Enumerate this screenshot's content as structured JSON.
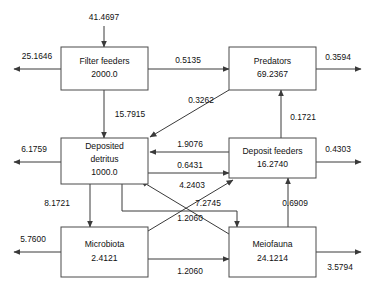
{
  "diagram": {
    "type": "ecological-flow-network",
    "nodes": [
      {
        "id": "filter_feeders",
        "label": "Filter feeders",
        "value": "2000.0",
        "lines": [
          "Filter feeders",
          "2000.0"
        ]
      },
      {
        "id": "predators",
        "label": "Predators",
        "value": "69.2367",
        "lines": [
          "Predators",
          "69.2367"
        ]
      },
      {
        "id": "deposited_detritus",
        "label": "Deposited detritus",
        "value": "1000.0",
        "lines": [
          "Deposited",
          "detritus",
          "1000.0"
        ]
      },
      {
        "id": "deposit_feeders",
        "label": "Deposit feeders",
        "value": "16.2740",
        "lines": [
          "Deposit feeders",
          "16.2740"
        ]
      },
      {
        "id": "microbiota",
        "label": "Microbiota",
        "value": "2.4121",
        "lines": [
          "Microbiota",
          "2.4121"
        ]
      },
      {
        "id": "meiofauna",
        "label": "Meiofauna",
        "value": "24.1214",
        "lines": [
          "Meiofauna",
          "24.1214"
        ]
      }
    ],
    "flows": [
      {
        "id": "input_filter_feeders",
        "value": "41.4697",
        "from": "external",
        "to": "filter_feeders"
      },
      {
        "id": "output_filter_feeders",
        "value": "25.1646",
        "from": "filter_feeders",
        "to": "external"
      },
      {
        "id": "filter_to_predators",
        "value": "0.5135",
        "from": "filter_feeders",
        "to": "predators"
      },
      {
        "id": "output_predators",
        "value": "0.3594",
        "from": "predators",
        "to": "external"
      },
      {
        "id": "filter_to_detritus",
        "value": "15.7915",
        "from": "filter_feeders",
        "to": "deposited_detritus"
      },
      {
        "id": "predators_to_detritus",
        "value": "0.3262",
        "from": "predators",
        "to": "deposited_detritus"
      },
      {
        "id": "output_detritus",
        "value": "6.1759",
        "from": "deposited_detritus",
        "to": "external"
      },
      {
        "id": "depositfeeders_to_detritus",
        "value": "1.9076",
        "from": "deposit_feeders",
        "to": "deposited_detritus"
      },
      {
        "id": "detritus_to_depositfeeders",
        "value": "0.6431",
        "from": "deposited_detritus",
        "to": "deposit_feeders"
      },
      {
        "id": "depositfeeders_to_predators",
        "value": "0.1721",
        "from": "deposit_feeders",
        "to": "predators"
      },
      {
        "id": "output_deposit_feeders",
        "value": "0.4303",
        "from": "deposit_feeders",
        "to": "external"
      },
      {
        "id": "detritus_to_microbiota",
        "value": "8.1721",
        "from": "deposited_detritus",
        "to": "microbiota"
      },
      {
        "id": "meiofauna_to_detritus",
        "value": "4.2403",
        "from": "meiofauna",
        "to": "deposited_detritus"
      },
      {
        "id": "detritus_to_meiofauna",
        "value": "7.2745",
        "from": "deposited_detritus",
        "to": "meiofauna"
      },
      {
        "id": "meiofauna_to_depositfeeders",
        "value": "0.6909",
        "from": "meiofauna",
        "to": "deposit_feeders"
      },
      {
        "id": "microbiota_to_depositfeeders",
        "value": "1.2060",
        "from": "microbiota",
        "to": "deposit_feeders"
      },
      {
        "id": "microbiota_to_meiofauna",
        "value": "1.2060",
        "from": "microbiota",
        "to": "meiofauna"
      },
      {
        "id": "output_microbiota",
        "value": "5.7600",
        "from": "microbiota",
        "to": "external"
      },
      {
        "id": "output_meiofauna",
        "value": "3.5794",
        "from": "meiofauna",
        "to": "external"
      }
    ],
    "colors": {
      "background": "#ffffff",
      "box_stroke": "#4a4a4a",
      "line_stroke": "#3a3a3a",
      "text": "#111111"
    }
  }
}
